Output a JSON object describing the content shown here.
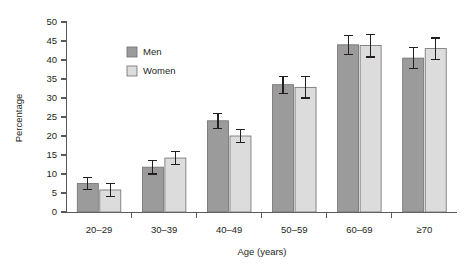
{
  "chart_data": {
    "type": "bar",
    "title": "",
    "subtitle": "",
    "xlabel": "Age (years)",
    "ylabel": "Percentage",
    "categories": [
      "20–29",
      "30–39",
      "40–49",
      "50–59",
      "60–69",
      "≥70"
    ],
    "ylim": [
      0,
      50
    ],
    "yticks": [
      0,
      5,
      10,
      15,
      20,
      25,
      30,
      35,
      40,
      45,
      50
    ],
    "ytick_labels": [
      "0",
      "5",
      "10",
      "15",
      "20",
      "25",
      "30",
      "35",
      "40",
      "45",
      "50"
    ],
    "grid": false,
    "legend_position": "upper-left-inside",
    "error_bars": "symmetric",
    "series": [
      {
        "name": "Men",
        "color": "#9b9b9b",
        "values": [
          7.5,
          11.8,
          24.0,
          33.5,
          44.0,
          40.5
        ],
        "errors": [
          1.5,
          1.8,
          2.0,
          2.2,
          2.5,
          2.8
        ]
      },
      {
        "name": "Women",
        "color": "#dcdcdc",
        "values": [
          5.8,
          14.2,
          20.0,
          32.8,
          43.8,
          43.0
        ],
        "errors": [
          1.8,
          1.8,
          1.8,
          2.8,
          3.0,
          2.8
        ]
      }
    ]
  },
  "legend": {
    "items": [
      {
        "label": "Men",
        "swatch": "#9b9b9b"
      },
      {
        "label": "Women",
        "swatch": "#dcdcdc"
      }
    ]
  },
  "axes": {
    "y_title": "Percentage",
    "x_title": "Age (years)"
  },
  "colors": {
    "men": "#9b9b9b",
    "women": "#dcdcdc",
    "axis": "#58595b",
    "text": "#231f20",
    "background": "#ffffff"
  }
}
